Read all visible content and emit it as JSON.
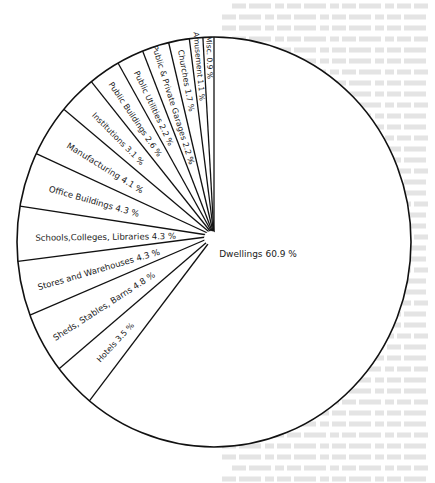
{
  "chart_data": {
    "type": "pie",
    "title": "",
    "start_angle_deg": 0,
    "direction": "counterclockwise-from-top",
    "slices": [
      {
        "label": "Misc. 0.9 %",
        "name": "Misc.",
        "value": 0.9
      },
      {
        "label": "Amusement 1.1 %",
        "name": "Amusement",
        "value": 1.1
      },
      {
        "label": "Churches 1.7 %",
        "name": "Churches",
        "value": 1.7
      },
      {
        "label": "Public & Private Garages 2.2 %",
        "name": "Public & Private Garages",
        "value": 2.2
      },
      {
        "label": "Public Utilities 2.2 %",
        "name": "Public Utilities",
        "value": 2.2
      },
      {
        "label": "Public Buildings 2.6 %",
        "name": "Public Buildings",
        "value": 2.6
      },
      {
        "label": "Institutions 3.1 %",
        "name": "Institutions",
        "value": 3.1
      },
      {
        "label": "Manufacturing 4.1 %",
        "name": "Manufacturing",
        "value": 4.1
      },
      {
        "label": "Office Buildings 4.3 %",
        "name": "Office Buildings",
        "value": 4.3
      },
      {
        "label": "Schools,Colleges, Libraries 4.3 %",
        "name": "Schools, Colleges, Libraries",
        "value": 4.3
      },
      {
        "label": "Stores and Warehouses 4.3 %",
        "name": "Stores and Warehouses",
        "value": 4.3
      },
      {
        "label": "Sheds, Stables, Barns 4.8 %",
        "name": "Sheds, Stables, Barns",
        "value": 4.8
      },
      {
        "label": "Hotels 3.5 %",
        "name": "Hotels",
        "value": 3.5
      },
      {
        "label": "Dwellings 60.9 %",
        "name": "Dwellings",
        "value": 60.9
      }
    ],
    "colors": {
      "stroke": "#111111",
      "fill": "#ffffff",
      "background": "#ffffff",
      "bleed_text": "#e4e4e4"
    },
    "legend": "none (labels inside slices)"
  }
}
